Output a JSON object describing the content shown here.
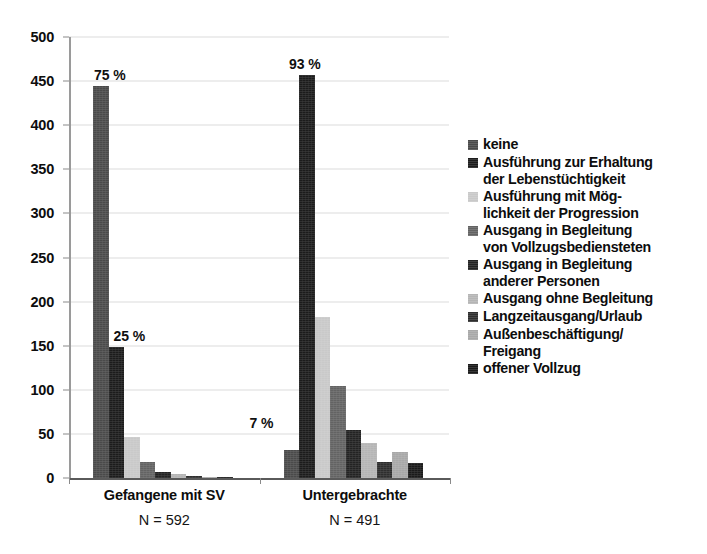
{
  "chart_data": {
    "type": "bar",
    "title": "",
    "subtitle": "",
    "xlabel": "",
    "ylabel": "",
    "ylim": [
      0,
      500
    ],
    "yticks": [
      0,
      50,
      100,
      150,
      200,
      250,
      300,
      350,
      400,
      450,
      500
    ],
    "ytick_labels": [
      "0",
      "50",
      "100",
      "150",
      "200",
      "250",
      "300",
      "350",
      "400",
      "450",
      "500"
    ],
    "grid": true,
    "grid_axis": "y",
    "legend_position": "right",
    "categories": [
      "Gefangene mit SV",
      "Untergebrachte"
    ],
    "category_sublabels": [
      "N = 592",
      "N = 491"
    ],
    "series": [
      {
        "name": "keine",
        "color": "#4a4a4a",
        "values": [
          444,
          32
        ]
      },
      {
        "name": "Ausführung zur Erhaltung\nder Lebenstüchtigkeit",
        "color": "#1c1c1c",
        "values": [
          148,
          457
        ]
      },
      {
        "name": "Ausführung mit Mög-\nlichkeit der Progression",
        "color": "#c9c9c9",
        "values": [
          47,
          183
        ]
      },
      {
        "name": "Ausgang in Begleitung\nvon Vollzugsbediensteten",
        "color": "#636363",
        "values": [
          18,
          104
        ]
      },
      {
        "name": "Ausgang in Begleitung\nanderer Personen",
        "color": "#232323",
        "values": [
          7,
          55
        ]
      },
      {
        "name": "Ausgang ohne Begleitung",
        "color": "#b5b5b5",
        "values": [
          4,
          40
        ]
      },
      {
        "name": "Langzeitausgang/Urlaub",
        "color": "#2e2e2e",
        "values": [
          2,
          18
        ]
      },
      {
        "name": "Außenbeschäftigung/\nFreigang",
        "color": "#a8a8a8",
        "values": [
          1,
          30
        ]
      },
      {
        "name": "offener Vollzug",
        "color": "#1a1a1a",
        "values": [
          1,
          17
        ]
      }
    ],
    "annotations": [
      {
        "text": "75 %",
        "category": "Gefangene mit SV",
        "series": "keine"
      },
      {
        "text": "25 %",
        "category": "Gefangene mit SV",
        "series": "Ausführung zur Erhaltung der Lebenstüchtigkeit"
      },
      {
        "text": "7 %",
        "category": "Untergebrachte",
        "series": "keine"
      },
      {
        "text": "93 %",
        "category": "Untergebrachte",
        "series": "Ausführung zur Erhaltung der Lebenstüchtigkeit"
      }
    ]
  }
}
